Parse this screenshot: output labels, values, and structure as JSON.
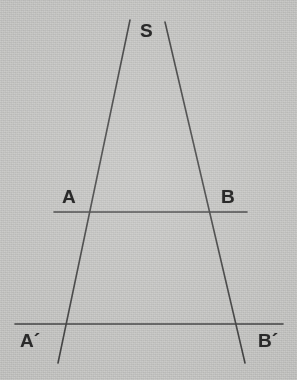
{
  "figure": {
    "background_color": "#c6c6c4",
    "ink_color": "#3a3a3a",
    "width": 297,
    "height": 380
  },
  "labels": {
    "apex": "S",
    "point_a": "A",
    "point_b": "B",
    "point_a_prime": "A´",
    "point_b_prime": "B´"
  },
  "geometry": {
    "apex_point": {
      "x": 148,
      "y": 87
    },
    "left_ray": {
      "x1": 130,
      "y1": 20,
      "x2": 58,
      "y2": 363
    },
    "right_ray": {
      "x1": 165,
      "y1": 22,
      "x2": 245,
      "y2": 363
    },
    "line_ab": {
      "x1": 54,
      "y1": 212,
      "x2": 247,
      "y2": 212
    },
    "line_ab_prime": {
      "x1": 15,
      "y1": 324,
      "x2": 283,
      "y2": 324
    },
    "intersections": {
      "a_on_left_ray": {
        "x": 107,
        "y": 212
      },
      "b_on_right_ray": {
        "x": 195,
        "y": 212
      },
      "a_prime_on_left_ray": {
        "x": 68,
        "y": 324
      },
      "b_prime_on_right_ray": {
        "x": 232,
        "y": 324
      }
    },
    "label_positions": {
      "apex": {
        "x": 140,
        "y": 21
      },
      "point_a": {
        "x": 62,
        "y": 187
      },
      "point_b": {
        "x": 221,
        "y": 187
      },
      "point_a_prime": {
        "x": 20,
        "y": 331
      },
      "point_b_prime": {
        "x": 258,
        "y": 331
      }
    },
    "stroke_width": 1.6
  }
}
